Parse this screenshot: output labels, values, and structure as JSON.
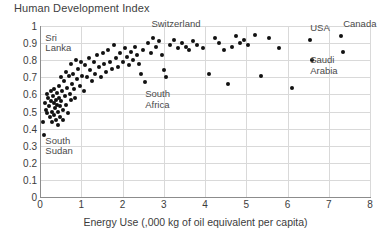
{
  "chart_data": {
    "type": "scatter",
    "title": "Human Development Index",
    "xlabel": "Energy Use (,000 kg of oil equivalent per capita)",
    "ylabel": "Human Development Index",
    "xlim": [
      0,
      8
    ],
    "ylim": [
      0,
      1
    ],
    "xticks": [
      "0",
      "1",
      "2",
      "3",
      "4",
      "5",
      "6",
      "7",
      "8"
    ],
    "yticks": [
      "0",
      "0.1",
      "0.2",
      "0.3",
      "0.4",
      "0.5",
      "0.6",
      "0.7",
      "0.8",
      "0.9",
      "1"
    ],
    "grid": true,
    "legend": "none",
    "marker_color": "#111111",
    "grid_color": "#d9d9d9",
    "axis_color": "#8c8c8c",
    "annotations": [
      {
        "label": "Sri\nLanka",
        "x": 0.13,
        "y": 0.93,
        "align": "left"
      },
      {
        "label": "South\nSudan",
        "x": 0.13,
        "y": 0.33,
        "align": "left"
      },
      {
        "label": "South\nAfrica",
        "x": 2.55,
        "y": 0.6,
        "align": "left"
      },
      {
        "label": "Switzerland",
        "x": 2.7,
        "y": 1.01,
        "align": "left"
      },
      {
        "label": "USA",
        "x": 6.55,
        "y": 0.99,
        "align": "left"
      },
      {
        "label": "Canada",
        "x": 7.35,
        "y": 1.01,
        "align": "left"
      },
      {
        "label": "Saudi\nArabia",
        "x": 6.55,
        "y": 0.8,
        "align": "left"
      }
    ],
    "points": [
      [
        0.08,
        0.44
      ],
      [
        0.1,
        0.36
      ],
      [
        0.13,
        0.55
      ],
      [
        0.14,
        0.51
      ],
      [
        0.16,
        0.6
      ],
      [
        0.18,
        0.49
      ],
      [
        0.2,
        0.58
      ],
      [
        0.22,
        0.53
      ],
      [
        0.24,
        0.47
      ],
      [
        0.26,
        0.62
      ],
      [
        0.27,
        0.56
      ],
      [
        0.29,
        0.5
      ],
      [
        0.3,
        0.44
      ],
      [
        0.31,
        0.59
      ],
      [
        0.33,
        0.55
      ],
      [
        0.34,
        0.48
      ],
      [
        0.35,
        0.63
      ],
      [
        0.36,
        0.52
      ],
      [
        0.38,
        0.57
      ],
      [
        0.39,
        0.45
      ],
      [
        0.4,
        0.61
      ],
      [
        0.41,
        0.54
      ],
      [
        0.43,
        0.5
      ],
      [
        0.44,
        0.42
      ],
      [
        0.45,
        0.58
      ],
      [
        0.46,
        0.65
      ],
      [
        0.48,
        0.53
      ],
      [
        0.49,
        0.47
      ],
      [
        0.5,
        0.7
      ],
      [
        0.52,
        0.56
      ],
      [
        0.53,
        0.62
      ],
      [
        0.55,
        0.51
      ],
      [
        0.56,
        0.45
      ],
      [
        0.58,
        0.68
      ],
      [
        0.6,
        0.59
      ],
      [
        0.62,
        0.73
      ],
      [
        0.63,
        0.54
      ],
      [
        0.65,
        0.64
      ],
      [
        0.67,
        0.49
      ],
      [
        0.7,
        0.71
      ],
      [
        0.72,
        0.6
      ],
      [
        0.74,
        0.57
      ],
      [
        0.76,
        0.78
      ],
      [
        0.78,
        0.66
      ],
      [
        0.8,
        0.72
      ],
      [
        0.82,
        0.63
      ],
      [
        0.85,
        0.58
      ],
      [
        0.88,
        0.8
      ],
      [
        0.9,
        0.69
      ],
      [
        0.93,
        0.75
      ],
      [
        0.96,
        0.65
      ],
      [
        1.0,
        0.79
      ],
      [
        1.03,
        0.71
      ],
      [
        1.06,
        0.62
      ],
      [
        1.1,
        0.77
      ],
      [
        1.14,
        0.7
      ],
      [
        1.18,
        0.81
      ],
      [
        1.22,
        0.74
      ],
      [
        1.26,
        0.68
      ],
      [
        1.3,
        0.79
      ],
      [
        1.34,
        0.72
      ],
      [
        1.38,
        0.83
      ],
      [
        1.42,
        0.76
      ],
      [
        1.48,
        0.7
      ],
      [
        1.52,
        0.84
      ],
      [
        1.56,
        0.78
      ],
      [
        1.6,
        0.73
      ],
      [
        1.65,
        0.86
      ],
      [
        1.7,
        0.79
      ],
      [
        1.75,
        0.75
      ],
      [
        1.8,
        0.89
      ],
      [
        1.85,
        0.81
      ],
      [
        1.9,
        0.76
      ],
      [
        1.95,
        0.84
      ],
      [
        2.0,
        0.79
      ],
      [
        2.05,
        0.87
      ],
      [
        2.1,
        0.82
      ],
      [
        2.15,
        0.77
      ],
      [
        2.2,
        0.85
      ],
      [
        2.25,
        0.8
      ],
      [
        2.3,
        0.88
      ],
      [
        2.35,
        0.83
      ],
      [
        2.4,
        0.78
      ],
      [
        2.45,
        0.72
      ],
      [
        2.5,
        0.86
      ],
      [
        2.55,
        0.67
      ],
      [
        2.62,
        0.9
      ],
      [
        2.68,
        0.84
      ],
      [
        2.75,
        0.93
      ],
      [
        2.8,
        0.88
      ],
      [
        2.88,
        0.91
      ],
      [
        2.95,
        0.83
      ],
      [
        3.0,
        0.74
      ],
      [
        3.05,
        0.7
      ],
      [
        3.15,
        0.89
      ],
      [
        3.25,
        0.92
      ],
      [
        3.35,
        0.87
      ],
      [
        3.45,
        0.9
      ],
      [
        3.55,
        0.88
      ],
      [
        3.62,
        0.86
      ],
      [
        3.7,
        0.91
      ],
      [
        3.8,
        0.89
      ],
      [
        3.95,
        0.87
      ],
      [
        4.1,
        0.72
      ],
      [
        4.25,
        0.93
      ],
      [
        4.35,
        0.9
      ],
      [
        4.45,
        0.86
      ],
      [
        4.55,
        0.66
      ],
      [
        4.65,
        0.88
      ],
      [
        4.75,
        0.94
      ],
      [
        4.85,
        0.9
      ],
      [
        4.95,
        0.92
      ],
      [
        5.05,
        0.89
      ],
      [
        5.2,
        0.95
      ],
      [
        5.35,
        0.71
      ],
      [
        5.55,
        0.93
      ],
      [
        5.8,
        0.87
      ],
      [
        6.1,
        0.64
      ],
      [
        6.55,
        0.92
      ],
      [
        6.6,
        0.8
      ],
      [
        7.3,
        0.94
      ],
      [
        7.35,
        0.85
      ]
    ]
  }
}
